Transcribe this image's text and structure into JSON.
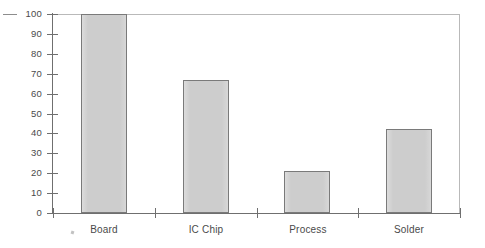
{
  "chart_data": {
    "type": "bar",
    "title": "",
    "subtitle": "",
    "xlabel": "",
    "ylabel": "",
    "categories": [
      "Board",
      "IC Chip",
      "Process",
      "Solder"
    ],
    "values": [
      100,
      67,
      21,
      42
    ],
    "series": [
      {
        "name": "",
        "values": [
          100,
          67,
          21,
          42
        ]
      }
    ],
    "ylim": [
      0,
      100
    ],
    "ytick_labels": [
      "100",
      "90",
      "80",
      "70",
      "60",
      "50",
      "40",
      "30",
      "20",
      "10",
      "0"
    ],
    "ytick_values": [
      100,
      90,
      80,
      70,
      60,
      50,
      40,
      30,
      20,
      10,
      0
    ],
    "grid": false,
    "legend": false,
    "legend_position": "none",
    "annotations": [],
    "colors": {
      "bar_fill": "#cdcdcd",
      "bar_border": "#7a7a7a",
      "axis": "#6f6f6f",
      "plot_border": "#b9b9b9",
      "text": "#4a4a4a",
      "background": "#ffffff"
    }
  }
}
